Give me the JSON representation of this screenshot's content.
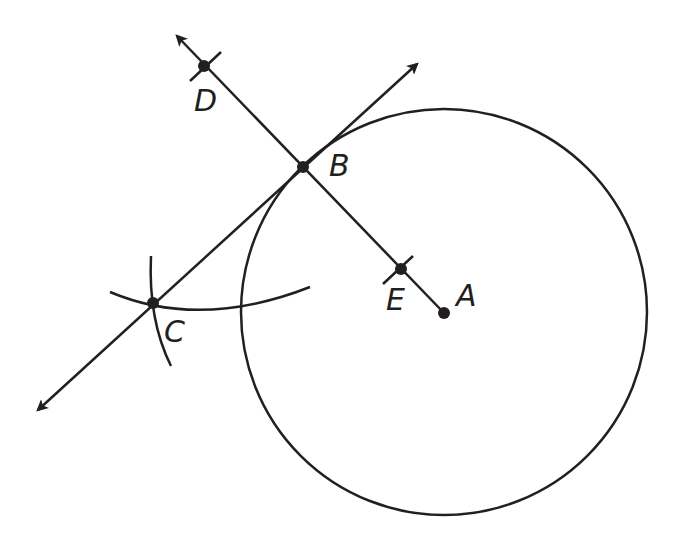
{
  "diagram": {
    "stroke_color": "#231f20",
    "background": "#ffffff",
    "circle": {
      "center_label": "A",
      "cx": 444,
      "cy": 312,
      "r": 203
    },
    "points": {
      "A": {
        "label": "A",
        "x": 444,
        "y": 313,
        "label_x": 456,
        "label_y": 306
      },
      "B": {
        "label": "B",
        "x": 303,
        "y": 167,
        "label_x": 329,
        "label_y": 176
      },
      "C": {
        "label": "C",
        "x": 153,
        "y": 303,
        "label_x": 164,
        "label_y": 342
      },
      "D": {
        "label": "D",
        "x": 204,
        "y": 66,
        "label_x": 194,
        "label_y": 111
      },
      "E": {
        "label": "E",
        "x": 401,
        "y": 269,
        "label_x": 386,
        "label_y": 310
      }
    },
    "lines": [
      {
        "name": "line-DA",
        "description": "Line through D, B, E ending at A, arrow beyond D"
      },
      {
        "name": "line-CB",
        "description": "Tangent line through C and B, arrows at both ends"
      }
    ]
  }
}
